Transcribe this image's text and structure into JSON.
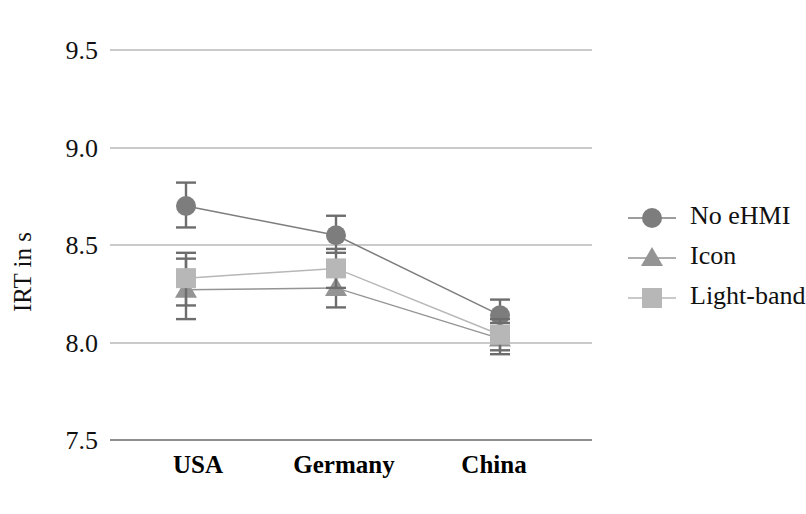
{
  "chart_data": {
    "type": "line",
    "title": "",
    "xlabel": "",
    "ylabel": "IRT in s",
    "categories": [
      "USA",
      "Germany",
      "China"
    ],
    "ylim": [
      7.5,
      9.5
    ],
    "yticks": [
      "7.5",
      "8.0",
      "8.5",
      "9.0",
      "9.5"
    ],
    "ytick_values": [
      7.5,
      8.0,
      8.5,
      9.0,
      9.5
    ],
    "grid": true,
    "legend_position": "right",
    "series": [
      {
        "name": "No eHMI",
        "marker": "circle",
        "color": "#7d7d7d",
        "values": [
          8.7,
          8.55,
          8.14
        ],
        "err_low": [
          8.59,
          8.46,
          8.07
        ],
        "err_high": [
          8.82,
          8.65,
          8.22
        ]
      },
      {
        "name": "Icon",
        "marker": "triangle",
        "color": "#949494",
        "values": [
          8.27,
          8.28,
          8.02
        ],
        "err_low": [
          8.12,
          8.18,
          7.94
        ],
        "err_high": [
          8.43,
          8.4,
          8.1
        ]
      },
      {
        "name": "Light-band",
        "marker": "square",
        "color": "#b7b7b7",
        "values": [
          8.33,
          8.38,
          8.04
        ],
        "err_low": [
          8.19,
          8.28,
          7.96
        ],
        "err_high": [
          8.46,
          8.48,
          8.12
        ]
      }
    ]
  },
  "legend": {
    "entries": [
      {
        "label": "No eHMI"
      },
      {
        "label": "Icon"
      },
      {
        "label": "Light-band"
      }
    ]
  },
  "axes": {
    "y_title": "IRT in s",
    "y_tick_0": "7.5",
    "y_tick_1": "8.0",
    "y_tick_2": "8.5",
    "y_tick_3": "9.0",
    "y_tick_4": "9.5",
    "x_tick_0": "USA",
    "x_tick_1": "Germany",
    "x_tick_2": "China"
  },
  "colors": {
    "no_ehmi": "#7d7d7d",
    "icon": "#949494",
    "light_band": "#b7b7b7",
    "grid": "#b9b9b9",
    "axis": "#8f8f8f"
  }
}
